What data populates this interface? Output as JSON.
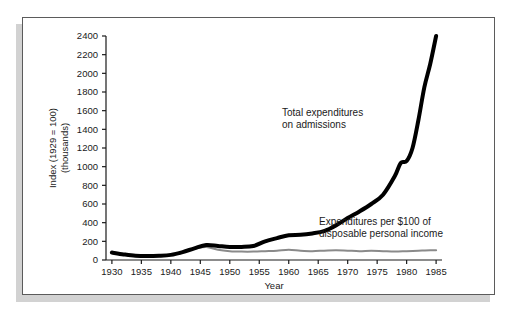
{
  "figure": {
    "background_color": "#ffffff",
    "frame_color": "#5b5b5b",
    "shadow_color": "#d2d2d2"
  },
  "chart_data": {
    "type": "line",
    "title": "",
    "xlabel": "Year",
    "ylabel_line1": "Index (1929 = 100)",
    "ylabel_line2": "(thousands)",
    "xlim": [
      1929,
      1986
    ],
    "ylim": [
      0,
      2400
    ],
    "xticks": [
      1930,
      1935,
      1940,
      1945,
      1950,
      1955,
      1960,
      1965,
      1970,
      1975,
      1980,
      1985
    ],
    "xtick_labels": [
      "1930",
      "1935",
      "1940",
      "1945",
      "1950",
      "1955",
      "1960",
      "1965",
      "1970",
      "1975",
      "1980",
      "1985"
    ],
    "yticks": [
      0,
      200,
      400,
      600,
      800,
      1000,
      1200,
      1400,
      1600,
      1800,
      2000,
      2200,
      2400
    ],
    "ytick_labels": [
      "0",
      "200",
      "400",
      "600",
      "800",
      "1000",
      "1200",
      "1400",
      "1600",
      "1800",
      "2000",
      "2200",
      "2400"
    ],
    "grid": false,
    "legend_position": "annotations-inline",
    "series": [
      {
        "name": "Total expenditures on admissions",
        "color": "#000000",
        "line_width": 4,
        "annotation_line1": "Total expenditures",
        "annotation_line2": "on admissions",
        "x": [
          1930,
          1932,
          1934,
          1936,
          1938,
          1940,
          1942,
          1944,
          1946,
          1948,
          1950,
          1952,
          1954,
          1956,
          1958,
          1960,
          1962,
          1964,
          1966,
          1968,
          1970,
          1972,
          1974,
          1976,
          1978,
          1979,
          1980,
          1981,
          1982,
          1983,
          1984,
          1985
        ],
        "values": [
          80,
          60,
          45,
          42,
          45,
          55,
          85,
          125,
          160,
          150,
          140,
          140,
          150,
          200,
          235,
          265,
          270,
          285,
          310,
          370,
          450,
          520,
          600,
          700,
          900,
          1040,
          1060,
          1200,
          1500,
          1850,
          2100,
          2400
        ]
      },
      {
        "name": "Expenditures per $100 of disposable personal income",
        "color": "#8a8a8a",
        "line_width": 2,
        "annotation_line1": "Expenditures per $100 of",
        "annotation_line2": "disposable personal income",
        "x": [
          1944,
          1946,
          1948,
          1950,
          1952,
          1954,
          1956,
          1958,
          1960,
          1962,
          1964,
          1966,
          1968,
          1970,
          1972,
          1974,
          1976,
          1978,
          1980,
          1982,
          1984,
          1985
        ],
        "values": [
          120,
          140,
          110,
          95,
          90,
          90,
          95,
          100,
          110,
          100,
          95,
          100,
          105,
          100,
          95,
          100,
          95,
          90,
          95,
          100,
          105,
          105
        ]
      }
    ]
  }
}
